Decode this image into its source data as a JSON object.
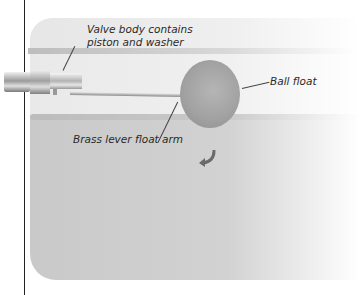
{
  "diagram": {
    "labels": {
      "valve_body_line1": "Valve body contains",
      "valve_body_line2": "piston and washer",
      "ball_float": "Ball float",
      "lever_arm": "Brass lever float arm"
    },
    "colors": {
      "tank_body": "#cccccc",
      "tank_lid": "#ececec",
      "ball": "#a5a5a5",
      "leader_lines": "#444444",
      "text": "#2a2a2a"
    }
  }
}
